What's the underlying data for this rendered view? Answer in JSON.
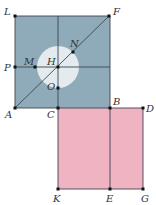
{
  "colors": {
    "blue_square": "#8fabb9",
    "pink_rect": "#f0b3c2",
    "circle": "#e3ebee",
    "line": "#3a4650",
    "point": "#111111"
  },
  "shapes": {
    "blue_square": {
      "vertices": [
        "L",
        "F",
        "B",
        "A"
      ]
    },
    "pink_rect": {
      "vertices": [
        "C",
        "D",
        "G",
        "K"
      ]
    },
    "circle": {
      "center": "H",
      "through": [
        "N",
        "O"
      ]
    }
  },
  "points": [
    {
      "id": "L",
      "label": "L",
      "x": 15,
      "y": 16,
      "lx": 4,
      "ly": 15
    },
    {
      "id": "F",
      "label": "F",
      "x": 109,
      "y": 16,
      "lx": 113,
      "ly": 15
    },
    {
      "id": "P",
      "label": "P",
      "x": 15,
      "y": 67,
      "lx": 4,
      "ly": 71
    },
    {
      "id": "M",
      "label": "M",
      "x": 35,
      "y": 67,
      "lx": 24,
      "ly": 65
    },
    {
      "id": "H",
      "label": "H",
      "x": 58,
      "y": 67,
      "lx": 47,
      "ly": 65
    },
    {
      "id": "N",
      "label": "N",
      "x": 73,
      "y": 52,
      "lx": 70,
      "ly": 47
    },
    {
      "id": "O",
      "label": "O",
      "x": 58,
      "y": 88,
      "lx": 47,
      "ly": 90
    },
    {
      "id": "A",
      "label": "A",
      "x": 15,
      "y": 108,
      "lx": 5,
      "ly": 118
    },
    {
      "id": "C",
      "label": "C",
      "x": 58,
      "y": 108,
      "lx": 47,
      "ly": 118
    },
    {
      "id": "B",
      "label": "B",
      "x": 110,
      "y": 108,
      "lx": 113,
      "ly": 105
    },
    {
      "id": "D",
      "label": "D",
      "x": 143,
      "y": 108,
      "lx": 146,
      "ly": 112
    },
    {
      "id": "K",
      "label": "K",
      "x": 58,
      "y": 189,
      "lx": 53,
      "ly": 202
    },
    {
      "id": "E",
      "label": "E",
      "x": 110,
      "y": 189,
      "lx": 106,
      "ly": 202
    },
    {
      "id": "G",
      "label": "G",
      "x": 143,
      "y": 189,
      "lx": 141,
      "ly": 202
    }
  ],
  "segments": [
    [
      "L",
      "F"
    ],
    [
      "F",
      "B"
    ],
    [
      "A",
      "L"
    ],
    [
      "A",
      "B"
    ],
    [
      "P",
      "H"
    ],
    [
      "H",
      "F"
    ],
    [
      "A",
      "F"
    ],
    [
      "C",
      "K"
    ],
    [
      "B",
      "E"
    ],
    [
      "B",
      "D"
    ],
    [
      "D",
      "G"
    ],
    [
      "K",
      "G"
    ],
    [
      "C",
      "top_mid"
    ]
  ]
}
